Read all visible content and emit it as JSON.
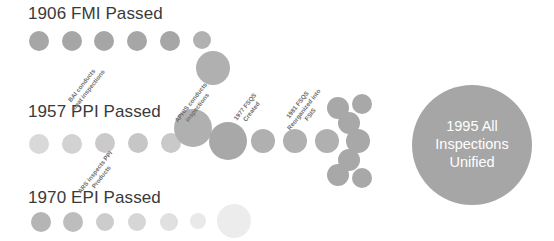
{
  "diagram": {
    "title_row_1": "1906 FMI Passed",
    "title_row_2": "1957 PPI Passed",
    "title_row_3": "1970 EPI Passed",
    "background_color": "#ffffff",
    "dot_color_dark": "#a6a6a6",
    "dot_color_mid": "#b9b9b9",
    "dot_color_light": "#d4d4d4",
    "dot_color_faint": "#e8e8e8",
    "hub_color": "#a6a6a6",
    "heading_color": "#3a3a3a",
    "label_color": "#6f6f6f"
  },
  "headings": [
    {
      "text": "1906 FMI Passed",
      "x": 28,
      "y": 4
    },
    {
      "text": "1957 PPI Passed",
      "x": 28,
      "y": 102
    },
    {
      "text": "1970 EPI Passed",
      "x": 28,
      "y": 188
    }
  ],
  "rotated_labels": [
    {
      "line1": "BAI conducts",
      "line2": "meat inspections",
      "x": 63,
      "y": 103,
      "rotation": -52
    },
    {
      "line1": "ARS inspects PPI",
      "line2": "Products",
      "x": 76,
      "y": 190,
      "rotation": -52
    },
    {
      "line1": "APHIS conducts",
      "line2": "inspections",
      "x": 173,
      "y": 119,
      "rotation": -52
    },
    {
      "line1": "1977 FSQS",
      "line2": "Created",
      "x": 232,
      "y": 117,
      "rotation": -52
    },
    {
      "line1": "1981 FSQS",
      "line2": "Reorganized into",
      "line3": "FSIS",
      "x": 279,
      "y": 122,
      "rotation": -52
    }
  ],
  "hub": {
    "line1": "1995 All",
    "line2": "Inspections",
    "line3": "Unified",
    "cx": 472,
    "cy": 145,
    "r": 60
  },
  "dots": [
    {
      "cx": 39,
      "cy": 41,
      "r": 10,
      "color": "#a6a6a6"
    },
    {
      "cx": 72,
      "cy": 41,
      "r": 10,
      "color": "#a6a6a6"
    },
    {
      "cx": 104,
      "cy": 41,
      "r": 10,
      "color": "#a6a6a6"
    },
    {
      "cx": 137,
      "cy": 41,
      "r": 10,
      "color": "#a6a6a6"
    },
    {
      "cx": 170,
      "cy": 41,
      "r": 10,
      "color": "#a6a6a6"
    },
    {
      "cx": 202,
      "cy": 40,
      "r": 9,
      "color": "#b1b1b1"
    },
    {
      "cx": 39,
      "cy": 144,
      "r": 10,
      "color": "#d9d9d9"
    },
    {
      "cx": 72,
      "cy": 144,
      "r": 10,
      "color": "#d2d2d2"
    },
    {
      "cx": 105,
      "cy": 143,
      "r": 10,
      "color": "#cacaca"
    },
    {
      "cx": 138,
      "cy": 143,
      "r": 10,
      "color": "#c6c6c6"
    },
    {
      "cx": 171,
      "cy": 143,
      "r": 10,
      "color": "#c9c9c9"
    },
    {
      "cx": 41,
      "cy": 222,
      "r": 10,
      "color": "#b5b5b5"
    },
    {
      "cx": 73,
      "cy": 222,
      "r": 10,
      "color": "#bdbdbd"
    },
    {
      "cx": 105,
      "cy": 222,
      "r": 9,
      "color": "#cccccc"
    },
    {
      "cx": 137,
      "cy": 222,
      "r": 9,
      "color": "#d6d6d6"
    },
    {
      "cx": 169,
      "cy": 222,
      "r": 9,
      "color": "#e0e0e0"
    },
    {
      "cx": 198,
      "cy": 221,
      "r": 8,
      "color": "#e9e9e9"
    },
    {
      "cx": 234,
      "cy": 221,
      "r": 17,
      "color": "#ececec"
    },
    {
      "cx": 213,
      "cy": 68,
      "r": 17,
      "color": "#b0b0b0"
    },
    {
      "cx": 193,
      "cy": 128,
      "r": 19,
      "color": "#b0b0b0"
    },
    {
      "cx": 228,
      "cy": 141,
      "r": 19,
      "color": "#a8a8a8"
    },
    {
      "cx": 263,
      "cy": 141,
      "r": 12,
      "color": "#b0b0b0"
    },
    {
      "cx": 295,
      "cy": 141,
      "r": 12,
      "color": "#b0b0b0"
    },
    {
      "cx": 327,
      "cy": 141,
      "r": 12,
      "color": "#b0b0b0"
    },
    {
      "cx": 358,
      "cy": 141,
      "r": 12,
      "color": "#a8a8a8"
    },
    {
      "cx": 338,
      "cy": 108,
      "r": 11,
      "color": "#a8a8a8"
    },
    {
      "cx": 349,
      "cy": 123,
      "r": 11,
      "color": "#a8a8a8"
    },
    {
      "cx": 349,
      "cy": 160,
      "r": 11,
      "color": "#a8a8a8"
    },
    {
      "cx": 338,
      "cy": 175,
      "r": 11,
      "color": "#a8a8a8"
    },
    {
      "cx": 362,
      "cy": 104,
      "r": 10,
      "color": "#a8a8a8"
    },
    {
      "cx": 362,
      "cy": 178,
      "r": 10,
      "color": "#a8a8a8"
    }
  ]
}
